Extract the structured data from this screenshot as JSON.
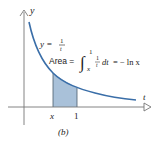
{
  "figure": {
    "caption": "(b)",
    "axes": {
      "x_label": "t",
      "y_label": "y"
    },
    "curve_label": {
      "lhs": "y =",
      "numerator": "1",
      "denominator": "t"
    },
    "area_label": {
      "prefix": "Area =",
      "integral_upper": "1",
      "integral_lower": "x",
      "integrand_num": "1",
      "integrand_den": "t",
      "differential": "dt",
      "result": "= − ln x"
    },
    "ticks": [
      {
        "label": "x"
      },
      {
        "label": "1"
      }
    ],
    "colors": {
      "curve": "#3a6ea8",
      "shade": "#a9c1d9",
      "axis": "#777777",
      "text": "#222222"
    }
  }
}
